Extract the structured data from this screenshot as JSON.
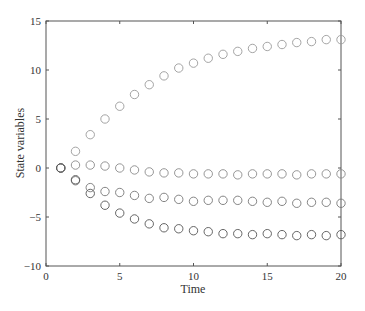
{
  "chart_data": {
    "type": "scatter",
    "title": "",
    "xlabel": "Time",
    "ylabel": "State variables",
    "xlim": [
      0,
      20
    ],
    "ylim": [
      -10,
      15
    ],
    "xticks": [
      0,
      5,
      10,
      15,
      20
    ],
    "yticks": [
      -10,
      -5,
      0,
      5,
      10,
      15
    ],
    "xtick_labels": [
      "0",
      "5",
      "10",
      "15",
      "20"
    ],
    "ytick_labels": [
      "−10",
      "−5",
      "0",
      "5",
      "10",
      "15"
    ],
    "grid": false,
    "legend": null,
    "marker": "circle-open",
    "x": [
      1,
      2,
      3,
      4,
      5,
      6,
      7,
      8,
      9,
      10,
      11,
      12,
      13,
      14,
      15,
      16,
      17,
      18,
      19,
      20
    ],
    "series": [
      {
        "name": "state-1",
        "color": "#9a9a9a",
        "values": [
          0,
          1.7,
          3.4,
          5.0,
          6.3,
          7.5,
          8.5,
          9.4,
          10.2,
          10.7,
          11.2,
          11.6,
          11.9,
          12.2,
          12.4,
          12.6,
          12.8,
          12.9,
          13.1,
          13.1
        ]
      },
      {
        "name": "state-2",
        "color": "#8a8a8a",
        "values": [
          0,
          0.3,
          0.3,
          0.2,
          0.0,
          -0.2,
          -0.4,
          -0.5,
          -0.5,
          -0.6,
          -0.6,
          -0.6,
          -0.7,
          -0.6,
          -0.6,
          -0.6,
          -0.7,
          -0.6,
          -0.6,
          -0.6
        ]
      },
      {
        "name": "state-3",
        "color": "#777777",
        "values": [
          0,
          -1.3,
          -2.0,
          -2.4,
          -2.5,
          -2.8,
          -3.1,
          -3.0,
          -3.2,
          -3.4,
          -3.3,
          -3.3,
          -3.3,
          -3.4,
          -3.5,
          -3.4,
          -3.6,
          -3.5,
          -3.5,
          -3.6
        ]
      },
      {
        "name": "state-4",
        "color": "#555555",
        "values": [
          0,
          -1.2,
          -2.6,
          -3.8,
          -4.6,
          -5.2,
          -5.7,
          -6.1,
          -6.2,
          -6.4,
          -6.5,
          -6.7,
          -6.7,
          -6.8,
          -6.7,
          -6.8,
          -6.9,
          -6.8,
          -6.9,
          -6.8
        ]
      }
    ]
  }
}
